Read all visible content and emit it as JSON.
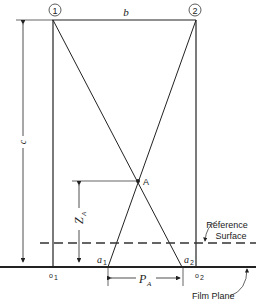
{
  "diagram": {
    "stations": [
      {
        "label": "1",
        "x": 55,
        "y": 10
      },
      {
        "label": "2",
        "x": 195,
        "y": 10
      }
    ],
    "base_label": "b",
    "height_label": "c",
    "point_label": "A",
    "height_A_label": "Z",
    "height_A_sub": "A",
    "parallax_label": "P",
    "parallax_sub": "A",
    "image_points": {
      "a1": {
        "main": "a",
        "sub": "1"
      },
      "a2": {
        "main": "a",
        "sub": "2"
      }
    },
    "principal_points": {
      "o1": {
        "main": "o",
        "sub": "1"
      },
      "o2": {
        "main": "o",
        "sub": "2"
      }
    },
    "reference_surface": {
      "line1": "Reference",
      "line2": "Surface"
    },
    "film_plane": "Film Plane"
  }
}
